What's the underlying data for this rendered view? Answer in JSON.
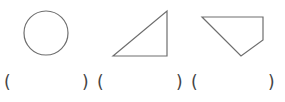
{
  "figures": [
    {
      "name": "circle",
      "shape": "circle",
      "cx": 46,
      "cy": 33,
      "r": 22
    },
    {
      "name": "right-triangle",
      "shape": "polygon",
      "points": "113,56 167,11 167,56"
    },
    {
      "name": "quadrilateral",
      "shape": "polygon",
      "points": "202,17 263,17 263,40 241,56"
    }
  ],
  "answer_blanks": [
    {
      "open": "(",
      "close": ")"
    },
    {
      "open": "(",
      "close": ")"
    },
    {
      "open": "(",
      "close": ")"
    }
  ],
  "colors": {
    "stroke": "#6e6e6e",
    "text": "#444444",
    "background": "#ffffff"
  }
}
